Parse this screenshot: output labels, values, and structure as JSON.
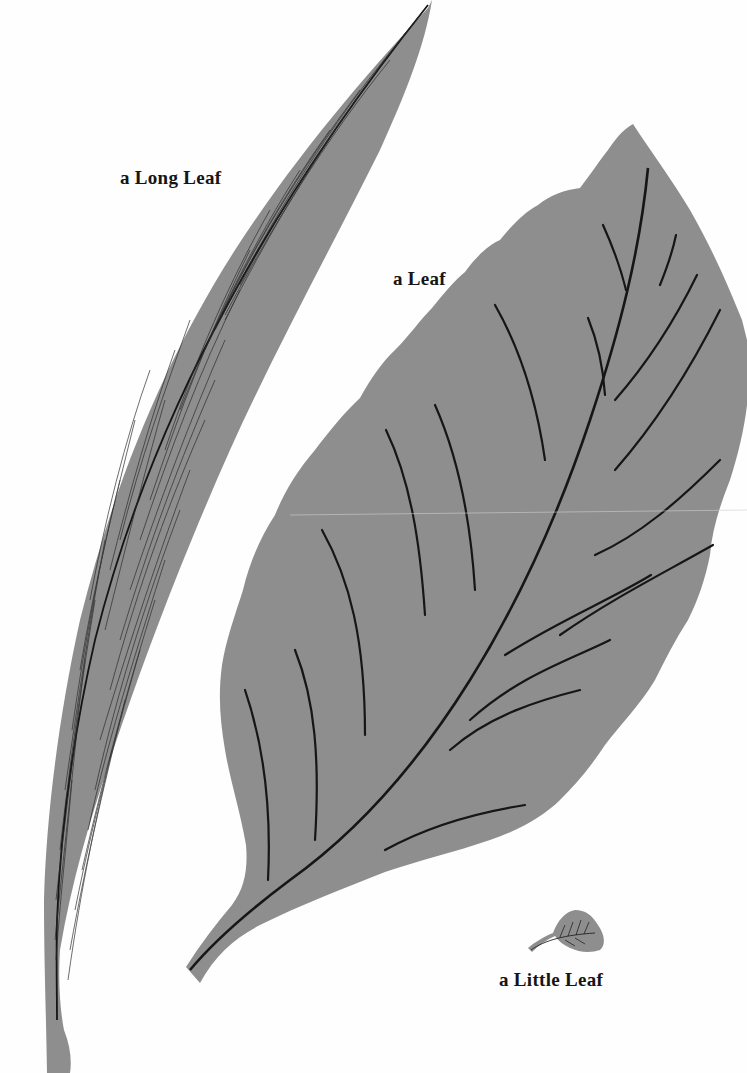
{
  "page": {
    "background_color": "#ffffff",
    "leaf_color": "#8e8e8e",
    "vein_color": "#1a1a1a",
    "caption_color": "#151515"
  },
  "captions": {
    "long_leaf": "a Long Leaf",
    "leaf": "a Leaf",
    "little_leaf": "a Little Leaf"
  },
  "illustrations": [
    {
      "name": "long-leaf",
      "caption": "a Long Leaf"
    },
    {
      "name": "leaf",
      "caption": "a Leaf"
    },
    {
      "name": "little-leaf",
      "caption": "a Little Leaf"
    }
  ]
}
